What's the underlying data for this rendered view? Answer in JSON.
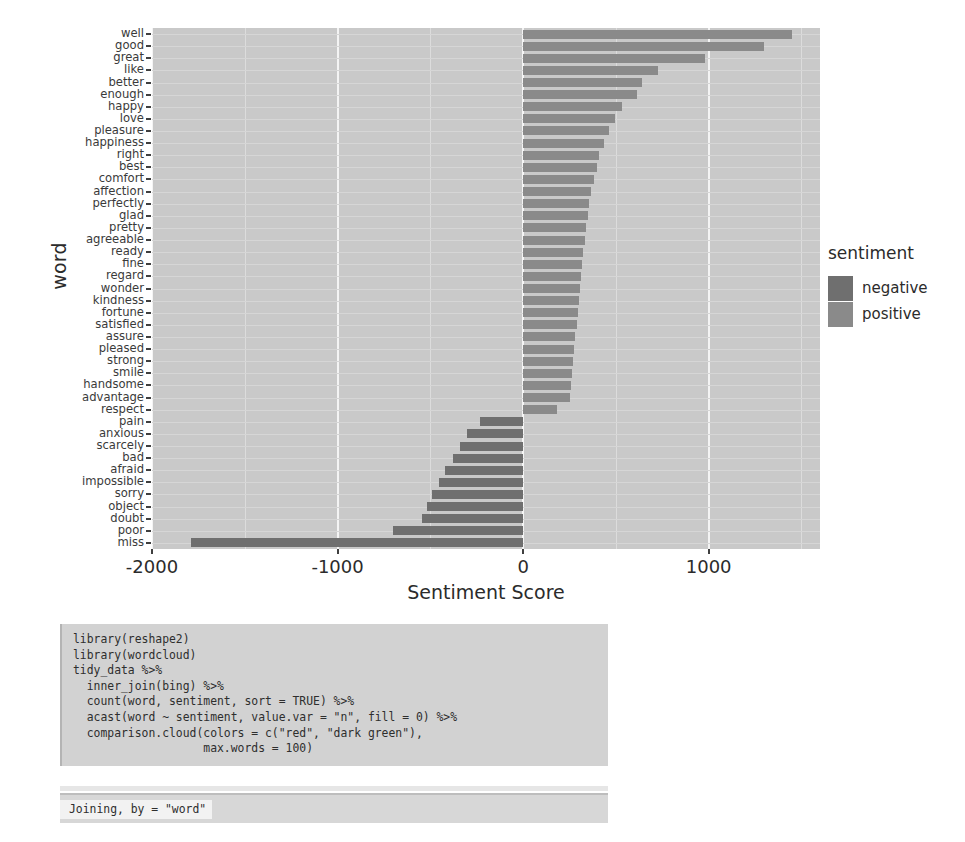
{
  "chart_data": {
    "type": "bar",
    "title": "",
    "xlabel": "Sentiment Score",
    "ylabel": "word",
    "orientation": "horizontal",
    "xlim": [
      -2000,
      1600
    ],
    "xticks": [
      -2000,
      -1000,
      0,
      1000
    ],
    "xticklabels": [
      "-2000",
      "-1000",
      "0",
      "1000"
    ],
    "grid": true,
    "legend": {
      "title": "sentiment",
      "position": "right",
      "entries": [
        {
          "label": "negative",
          "color": "#6f6f6f"
        },
        {
          "label": "positive",
          "color": "#8a8a8a"
        }
      ]
    },
    "categories": [
      "well",
      "good",
      "great",
      "like",
      "better",
      "enough",
      "happy",
      "love",
      "pleasure",
      "happiness",
      "right",
      "best",
      "comfort",
      "affection",
      "perfectly",
      "glad",
      "pretty",
      "agreeable",
      "ready",
      "fine",
      "regard",
      "wonder",
      "kindness",
      "fortune",
      "satisfied",
      "assure",
      "pleased",
      "strong",
      "smile",
      "handsome",
      "advantage",
      "respect",
      "pain",
      "anxious",
      "scarcely",
      "bad",
      "afraid",
      "impossible",
      "sorry",
      "object",
      "doubt",
      "poor",
      "miss"
    ],
    "values": [
      1447,
      1298,
      981,
      727,
      640,
      613,
      534,
      495,
      462,
      437,
      410,
      396,
      380,
      368,
      357,
      348,
      340,
      332,
      325,
      318,
      312,
      306,
      300,
      294,
      288,
      282,
      276,
      270,
      264,
      258,
      252,
      180,
      -230,
      -300,
      -342,
      -380,
      -420,
      -455,
      -490,
      -520,
      -545,
      -700,
      -1790
    ],
    "sentiments": [
      "positive",
      "positive",
      "positive",
      "positive",
      "positive",
      "positive",
      "positive",
      "positive",
      "positive",
      "positive",
      "positive",
      "positive",
      "positive",
      "positive",
      "positive",
      "positive",
      "positive",
      "positive",
      "positive",
      "positive",
      "positive",
      "positive",
      "positive",
      "positive",
      "positive",
      "positive",
      "positive",
      "positive",
      "positive",
      "positive",
      "positive",
      "positive",
      "negative",
      "negative",
      "negative",
      "negative",
      "negative",
      "negative",
      "negative",
      "negative",
      "negative",
      "negative",
      "negative"
    ]
  },
  "code_cell": {
    "language": "r",
    "lines": [
      "library(reshape2)",
      "library(wordcloud)",
      "tidy_data %>%",
      "  inner_join(bing) %>%",
      "  count(word, sentiment, sort = TRUE) %>%",
      "  acast(word ~ sentiment, value.var = \"n\", fill = 0) %>%",
      "  comparison.cloud(colors = c(\"red\", \"dark green\"),",
      "                   max.words = 100)"
    ]
  },
  "output_cell": {
    "lines": [
      "Joining, by = \"word\""
    ]
  },
  "colors": {
    "panel_background": "#c9c9c9",
    "gridline_major": "#f4f4f4",
    "gridline_minor": "#dcdcdc",
    "bar_negative": "#6f6f6f",
    "bar_positive": "#8a8a8a",
    "text": "#2b2b2b",
    "code_background": "#d2d2d2",
    "output_background": "#d7d7d7"
  }
}
